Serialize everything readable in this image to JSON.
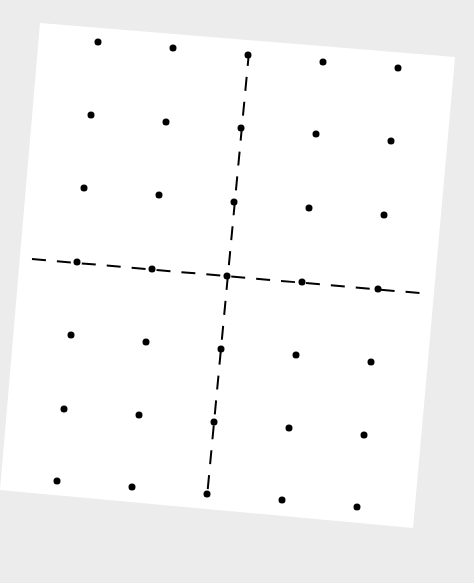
{
  "diagram": {
    "type": "dot-grid-with-axes",
    "background_color": "#ececec",
    "sheet_color": "#ffffff",
    "ink_color": "#000000",
    "sheet_corners": [
      [
        40,
        23
      ],
      [
        455,
        57
      ],
      [
        413,
        528
      ],
      [
        0,
        490
      ]
    ],
    "rows": 7,
    "cols": 5,
    "dots": [
      [
        [
          98,
          42
        ],
        [
          173,
          48
        ],
        [
          248,
          55
        ],
        [
          323,
          62
        ],
        [
          398,
          68
        ]
      ],
      [
        [
          91,
          115
        ],
        [
          166,
          122
        ],
        [
          241,
          128
        ],
        [
          316,
          134
        ],
        [
          391,
          141
        ]
      ],
      [
        [
          84,
          188
        ],
        [
          159,
          195
        ],
        [
          234,
          202
        ],
        [
          309,
          208
        ],
        [
          384,
          215
        ]
      ],
      [
        [
          77,
          262
        ],
        [
          152,
          269
        ],
        [
          227,
          276
        ],
        [
          302,
          282
        ],
        [
          378,
          289
        ]
      ],
      [
        [
          71,
          335
        ],
        [
          146,
          342
        ],
        [
          221,
          349
        ],
        [
          296,
          355
        ],
        [
          371,
          362
        ]
      ],
      [
        [
          64,
          409
        ],
        [
          139,
          415
        ],
        [
          214,
          422
        ],
        [
          289,
          428
        ],
        [
          364,
          435
        ]
      ],
      [
        [
          57,
          481
        ],
        [
          132,
          487
        ],
        [
          207,
          494
        ],
        [
          282,
          500
        ],
        [
          357,
          507
        ]
      ]
    ],
    "axes": {
      "horizontal": {
        "from": [
          32,
          259
        ],
        "to": [
          430,
          294
        ],
        "style": "dashed"
      },
      "vertical": {
        "from": [
          249,
          52
        ],
        "to": [
          207,
          497
        ],
        "style": "dashed"
      }
    }
  }
}
